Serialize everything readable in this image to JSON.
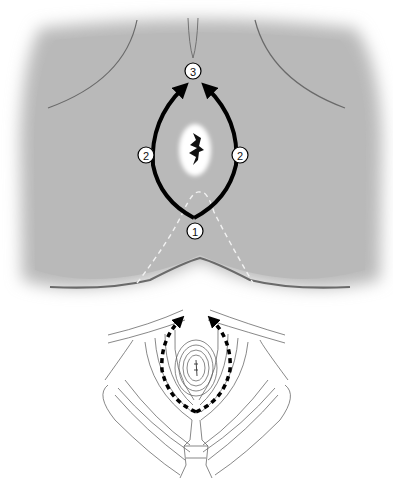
{
  "diagram": {
    "upper_panel": {
      "description": "Skin surface view with central lesion and arrows indicating incision direction",
      "labels": [
        {
          "id": "step-3",
          "text": "3"
        },
        {
          "id": "step-2-left",
          "text": "2"
        },
        {
          "id": "step-2-right",
          "text": "2"
        },
        {
          "id": "step-1",
          "text": "1"
        }
      ],
      "colors": {
        "skin": "#b9b9b9",
        "arrow": "#000000",
        "dashed_line": "#ffffff",
        "outline": "#6a6a6a"
      }
    },
    "lower_panel": {
      "description": "Muscle layer view with dashed arrows indicating dissection path"
    }
  }
}
